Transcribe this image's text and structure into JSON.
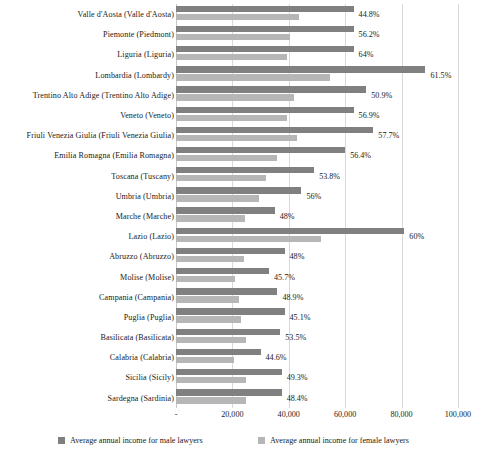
{
  "chart_data": {
    "type": "bar",
    "orientation": "horizontal",
    "title": "",
    "xlabel": "",
    "ylabel": "",
    "xlim": [
      0,
      100000
    ],
    "xticks": [
      0,
      20000,
      40000,
      60000,
      80000,
      100000
    ],
    "xtick_labels": [
      "-",
      "20,000",
      "40,000",
      "60,000",
      "80,000",
      "100,000"
    ],
    "grid": true,
    "legend_position": "bottom",
    "colors": {
      "male": "#808080",
      "female": "#b6b6b6",
      "gridline": "#d9d9d9",
      "text": "#1a1a1a",
      "background": "#ffffff"
    },
    "categories": [
      "Valle d'Aosta (Valle d'Aosta)",
      "Piemonte (Piedmont)",
      "Liguria (Liguria)",
      "Lombardia (Lombardy)",
      "Trentino Alto Adige (Trentino Alto Adige)",
      "Veneto (Veneto)",
      "Friuli Venezia Giulia (Friuli Venezia Giulia)",
      "Emilia Romagna (Emilia Romagna)",
      "Toscana (Tuscany)",
      "Umbria (Umbria)",
      "Marche (Marche)",
      "Lazio (Lazio)",
      "Abruzzo (Abruzzo)",
      "Molise (Molise)",
      "Campania (Campania)",
      "Puglia (Puglia)",
      "Basilicata (Basilicata)",
      "Calabria (Calabria)",
      "Sicilia (Sicily)",
      "Sardegna (Sardinia)"
    ],
    "series": [
      {
        "name": "Average annual income for male lawyers",
        "color": "#808080",
        "values": [
          63000,
          63000,
          63000,
          88500,
          67500,
          63000,
          70000,
          60000,
          49000,
          44500,
          35000,
          81000,
          38500,
          33000,
          36000,
          38500,
          37000,
          30000,
          37500,
          37500
        ]
      },
      {
        "name": "Average annual income for female lawyers",
        "color": "#b6b6b6",
        "values": [
          43500,
          40500,
          39500,
          54500,
          42000,
          39500,
          43000,
          36000,
          32000,
          29500,
          24500,
          51500,
          24000,
          21000,
          22500,
          23000,
          25000,
          20500,
          25000,
          25000
        ]
      }
    ],
    "data_labels": [
      "44.8%",
      "56.2%",
      "64%",
      "61.5%",
      "50.9%",
      "56.9%",
      "57.7%",
      "56.4%",
      "53.8%",
      "56%",
      "48%",
      "60%",
      "48%",
      "45.7%",
      "48.9%",
      "45.1%",
      "53.5%",
      "44.6%",
      "49.3%",
      "48.4%"
    ]
  },
  "legend": {
    "male_label": "Average annual income for male lawyers",
    "female_label": "Average annual income for female lawyers"
  }
}
